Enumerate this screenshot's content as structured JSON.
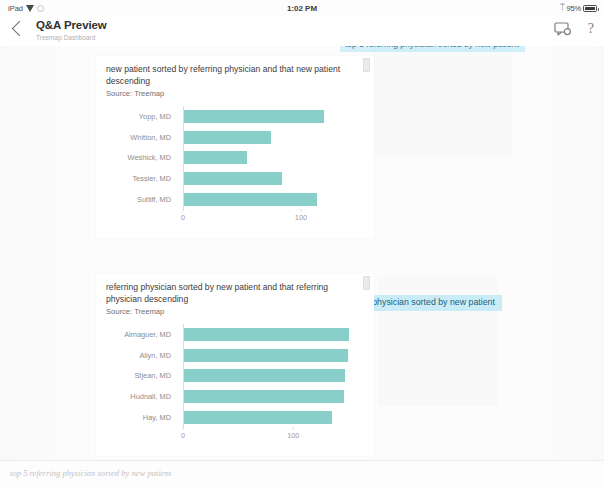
{
  "status_bar": {
    "device": "iPad",
    "wifi_icon": "wifi-icon",
    "location_icon": "location-icon",
    "time": "1:02 PM",
    "bluetooth_icon": "bluetooth-icon",
    "battery_percent": "95%",
    "battery_icon": "battery-icon"
  },
  "header": {
    "back_icon": "back-chevron-icon",
    "title": "Q&A Preview",
    "subtitle": "Treemap Dashboard",
    "comment_icon": "comment-icon",
    "help_icon": "help-question-icon"
  },
  "canvas": {
    "clipped_chip_text": "top 5 referring physician sorted by new patient",
    "highlight_chip": "top 5 referring physician sorted by new patient",
    "accent_color": "#7fcbc4",
    "highlight_color": "#c9ecf7"
  },
  "question_bar": {
    "text": "top 5 referring physician sorted by new patient",
    "placeholder": "Ask a question about your data"
  },
  "chart_data": [
    {
      "type": "bar",
      "orientation": "horizontal",
      "title": "new patient sorted by referring physician and that new patient descending",
      "source": "Source: Treemap",
      "categories": [
        "Yopp, MD",
        "Whitton, MD",
        "Weshick, MD",
        "Tessier, MD",
        "Sutliff, MD"
      ],
      "values": [
        119,
        74,
        53,
        83,
        113
      ],
      "xlabel": "",
      "ylabel": "",
      "xlim": [
        0,
        145
      ],
      "xticks": [
        "0",
        "100"
      ],
      "xtick_values": [
        0,
        100
      ],
      "grid": false,
      "legend": false,
      "bar_color": "#7fcbc4"
    },
    {
      "type": "bar",
      "orientation": "horizontal",
      "title": "referring physician sorted by new patient and that referring physician descending",
      "source": "Source: Treemap",
      "categories": [
        "Almaguer, MD",
        "Allyn, MD",
        "Stjean, MD",
        "Hudnall, MD",
        "Hay, MD"
      ],
      "values": [
        150,
        149,
        146,
        145,
        134
      ],
      "xlabel": "",
      "ylabel": "",
      "xlim": [
        0,
        155
      ],
      "xticks": [
        "0",
        "100"
      ],
      "xtick_values": [
        0,
        100
      ],
      "grid": false,
      "legend": false,
      "bar_color": "#7fcbc4"
    }
  ]
}
